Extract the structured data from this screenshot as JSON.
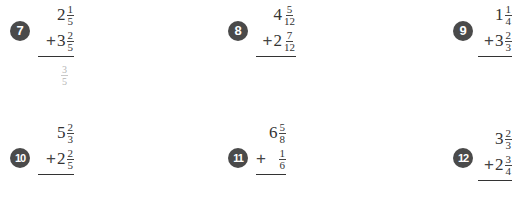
{
  "problems": [
    {
      "number": "7",
      "top": {
        "whole": "2",
        "num": "1",
        "den": "5"
      },
      "op": "+",
      "bottom": {
        "whole": "3",
        "num": "2",
        "den": "5"
      },
      "hint": {
        "num": "3",
        "den": "5"
      }
    },
    {
      "number": "8",
      "top": {
        "whole": "4",
        "num": "5",
        "den": "12"
      },
      "op": "+",
      "bottom": {
        "whole": "2",
        "num": "7",
        "den": "12"
      }
    },
    {
      "number": "9",
      "top": {
        "whole": "1",
        "num": "1",
        "den": "4"
      },
      "op": "+",
      "bottom": {
        "whole": "3",
        "num": "2",
        "den": "3"
      }
    },
    {
      "number": "10",
      "top": {
        "whole": "5",
        "num": "2",
        "den": "3"
      },
      "op": "+",
      "bottom": {
        "whole": "2",
        "num": "2",
        "den": "5"
      }
    },
    {
      "number": "11",
      "top": {
        "whole": "6",
        "num": "5",
        "den": "8"
      },
      "op": "+",
      "bottom": {
        "whole": "",
        "num": "1",
        "den": "6"
      }
    },
    {
      "number": "12",
      "top": {
        "whole": "3",
        "num": "2",
        "den": "3"
      },
      "op": "+",
      "bottom": {
        "whole": "2",
        "num": "3",
        "den": "4"
      }
    }
  ],
  "colors": {
    "badge": "#4a4a4a",
    "hint": "#b5b5b5"
  }
}
